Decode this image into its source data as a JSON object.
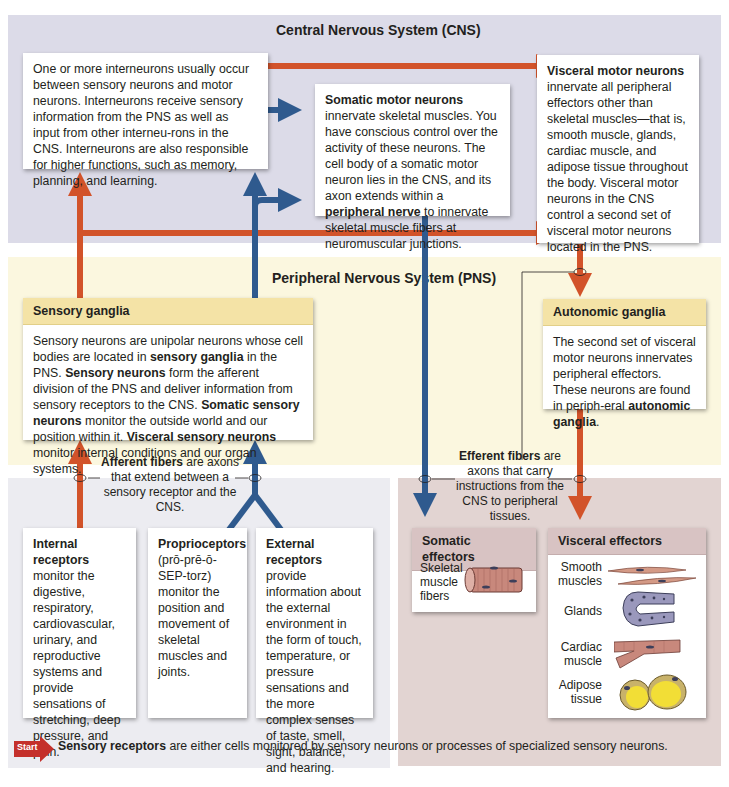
{
  "regions": {
    "cns": {
      "title": "Central Nervous System (CNS)",
      "color": "#dcdbe8"
    },
    "pns": {
      "title": "Peripheral Nervous System (PNS)",
      "color": "#fbf7df"
    },
    "receptors": {
      "color": "#ececf1"
    },
    "effectors": {
      "color": "#e2d4d2"
    }
  },
  "colors": {
    "afferent_arrow": "#d2532a",
    "efferent_arrow": "#2f5a8e",
    "ganglia_header": "#f4e3a6",
    "effector_header": "#d8c3c3",
    "start_badge": "#c4302b"
  },
  "interneurons": {
    "text": "One or more interneurons usually occur between sensory neurons and motor neurons. Interneurons receive sensory information from the PNS as well as input from other interneu-rons in the CNS. Interneurons are also responsible for higher functions, such as memory, planning, and learning."
  },
  "somatic_motor": {
    "bold": "Somatic motor neurons",
    "text1": " innervate skeletal muscles. You have conscious control over the activity of these neurons. The cell body of a somatic motor neuron lies in the CNS, and its axon extends within a ",
    "bold2": "peripheral nerve",
    "text2": " to innervate skeletal muscle fibers at neuromuscular junctions."
  },
  "visceral_motor": {
    "bold": "Visceral motor neurons",
    "text": " innervate all peripheral effectors other than skeletal muscles—that is, smooth muscle, glands, cardiac muscle, and adipose tissue throughout the body. Visceral motor neurons in the CNS control a second set of visceral motor neurons located in the PNS."
  },
  "sensory_ganglia": {
    "title": "Sensory ganglia",
    "t1": "Sensory neurons are unipolar neurons whose cell bodies are located in ",
    "b1": "sensory ganglia",
    "t2": " in the PNS. ",
    "b2": "Sensory neurons",
    "t3": " form the afferent division of the PNS and deliver information from sensory receptors to the CNS. ",
    "b3": "Somatic sensory neurons",
    "t4": " monitor the outside world and our position within it. ",
    "b4": "Visceral sensory neurons",
    "t5": " monitor internal conditions and our organ systems."
  },
  "autonomic_ganglia": {
    "title": "Autonomic ganglia",
    "t1": "The second set of visceral motor neurons innervates peripheral effectors. These neurons are found in periph-eral ",
    "b1": "autonomic ganglia",
    "t2": "."
  },
  "afferent_caption": {
    "bold": "Afferent fibers",
    "text": " are axons that extend between a sensory receptor and the CNS."
  },
  "efferent_caption": {
    "bold": "Efferent fibers",
    "text": " are axons that carry instructions from the CNS to peripheral tissues."
  },
  "receptors": [
    {
      "bold": "Internal receptors",
      "text": " monitor the digestive, respiratory, cardiovascular, urinary, and reproductive systems and provide sensations of stretching, deep pressure, and pain."
    },
    {
      "bold": "Proprioceptors",
      "text": " (prō-prē-ō-SEP-torz) monitor the position and movement of skeletal muscles and joints."
    },
    {
      "bold": "External receptors",
      "text": " provide information about the external environment in the form of touch, temperature, or pressure sensations and the more complex senses of taste, smell, sight, balance, and hearing."
    }
  ],
  "start": {
    "badge": "Start",
    "bold": "Sensory receptors",
    "text": " are either cells monitored by sensory neurons or processes of specialized sensory neurons."
  },
  "somatic_effectors": {
    "title": "Somatic effectors",
    "items": [
      {
        "label": "Skeletal muscle fibers",
        "icon": "skeletal-muscle-icon"
      }
    ]
  },
  "visceral_effectors": {
    "title": "Visceral effectors",
    "items": [
      {
        "label": "Smooth muscles",
        "icon": "smooth-muscle-icon"
      },
      {
        "label": "Glands",
        "icon": "gland-icon"
      },
      {
        "label": "Cardiac muscle",
        "icon": "cardiac-muscle-icon"
      },
      {
        "label": "Adipose tissue",
        "icon": "adipose-tissue-icon"
      }
    ]
  }
}
